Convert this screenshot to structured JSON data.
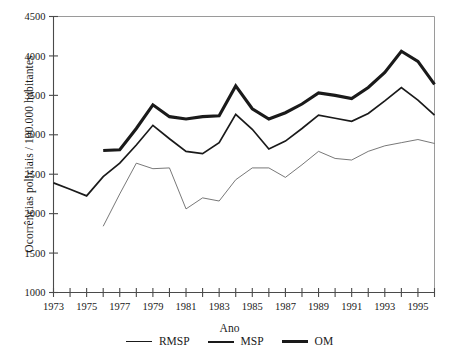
{
  "chart_data": {
    "type": "line",
    "title": "",
    "xlabel": "Ano",
    "ylabel": "Ocorrências policiais / 100.000 habitantes",
    "xlim": [
      1973,
      1996
    ],
    "ylim": [
      1000,
      4500
    ],
    "ytick_step": 500,
    "yticks": [
      1000,
      1500,
      2000,
      2500,
      3000,
      3500,
      4000,
      4500
    ],
    "ytick_labels": [
      "1000",
      "1500",
      "2000",
      "2500",
      "3000",
      "3500",
      "4000",
      "4500"
    ],
    "x": [
      1973,
      1974,
      1975,
      1976,
      1977,
      1978,
      1979,
      1980,
      1981,
      1982,
      1983,
      1984,
      1985,
      1986,
      1987,
      1988,
      1989,
      1990,
      1991,
      1992,
      1993,
      1994,
      1995,
      1996
    ],
    "xticks": [
      1973,
      1974,
      1975,
      1976,
      1977,
      1978,
      1979,
      1980,
      1981,
      1982,
      1983,
      1984,
      1985,
      1986,
      1987,
      1988,
      1989,
      1990,
      1991,
      1992,
      1993,
      1994,
      1995,
      1996
    ],
    "xtick_labels": [
      "1973",
      "",
      "1975",
      "",
      "1977",
      "",
      "1979",
      "",
      "1981",
      "",
      "1983",
      "",
      "1985",
      "",
      "1987",
      "",
      "1989",
      "",
      "1991",
      "",
      "1993",
      "",
      "1995",
      ""
    ],
    "grid": false,
    "legend_position": "bottom",
    "series": [
      {
        "name": "RMSP",
        "style": "thin",
        "color": "#555555",
        "linewidth": 0.8,
        "x": [
          1976,
          1977,
          1978,
          1979,
          1980,
          1981,
          1982,
          1983,
          1984,
          1985,
          1986,
          1987,
          1988,
          1989,
          1990,
          1991,
          1992,
          1993,
          1994,
          1995,
          1996
        ],
        "values": [
          1840,
          2250,
          2640,
          2570,
          2580,
          2060,
          2200,
          2160,
          2430,
          2580,
          2580,
          2460,
          2620,
          2790,
          2700,
          2680,
          2790,
          2860,
          2900,
          2940,
          2890
        ]
      },
      {
        "name": "MSP",
        "style": "medium",
        "color": "#1a1a1a",
        "linewidth": 1.7,
        "x": [
          1973,
          1974,
          1975,
          1976,
          1977,
          1978,
          1979,
          1980,
          1981,
          1982,
          1983,
          1984,
          1985,
          1986,
          1987,
          1988,
          1989,
          1990,
          1991,
          1992,
          1993,
          1994,
          1995,
          1996
        ],
        "values": [
          2390,
          2310,
          2225,
          2470,
          2640,
          2870,
          3120,
          2950,
          2790,
          2760,
          2900,
          3260,
          3070,
          2820,
          2920,
          3080,
          3250,
          3210,
          3170,
          3270,
          3430,
          3600,
          3440,
          3250
        ]
      },
      {
        "name": "OM",
        "style": "thick",
        "color": "#1a1a1a",
        "linewidth": 3.1,
        "x": [
          1976,
          1977,
          1978,
          1979,
          1980,
          1981,
          1982,
          1983,
          1984,
          1985,
          1986,
          1987,
          1988,
          1989,
          1990,
          1991,
          1992,
          1993,
          1994,
          1995,
          1996
        ],
        "values": [
          2800,
          2810,
          3080,
          3380,
          3230,
          3200,
          3230,
          3240,
          3620,
          3330,
          3200,
          3280,
          3390,
          3530,
          3500,
          3460,
          3600,
          3790,
          4060,
          3930,
          3640
        ]
      }
    ]
  },
  "legend": {
    "items": [
      {
        "label": "RMSP",
        "style": "thin"
      },
      {
        "label": "MSP",
        "style": "medium"
      },
      {
        "label": "OM",
        "style": "thick"
      }
    ]
  }
}
